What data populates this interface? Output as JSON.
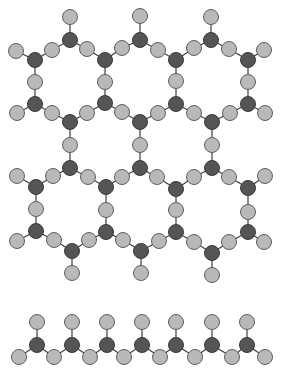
{
  "diagram": {
    "width": 289,
    "height": 375,
    "colors": {
      "background": "#ffffff",
      "light_atom": "#b9b9b9",
      "dark_atom": "#555555",
      "bond": "#3c3c3c"
    },
    "atom_radius": 7.5,
    "sheet": {
      "description": "hexagonal sheet of linked tetrahedra (two rows of rings)",
      "atoms": [
        {
          "id": "p1",
          "x": 70,
          "y": 17,
          "t": "light"
        },
        {
          "id": "p2",
          "x": 140,
          "y": 16,
          "t": "light"
        },
        {
          "id": "p3",
          "x": 211,
          "y": 17,
          "t": "light"
        },
        {
          "id": "a1",
          "x": 70,
          "y": 40,
          "t": "dark"
        },
        {
          "id": "a2",
          "x": 140,
          "y": 40,
          "t": "dark"
        },
        {
          "id": "a3",
          "x": 211,
          "y": 40,
          "t": "dark"
        },
        {
          "id": "b0",
          "x": 16,
          "y": 51,
          "t": "light"
        },
        {
          "id": "b1",
          "x": 52,
          "y": 50,
          "t": "light"
        },
        {
          "id": "b2",
          "x": 87,
          "y": 49,
          "t": "light"
        },
        {
          "id": "b3",
          "x": 122,
          "y": 48,
          "t": "light"
        },
        {
          "id": "b4",
          "x": 158,
          "y": 50,
          "t": "light"
        },
        {
          "id": "b5",
          "x": 194,
          "y": 48,
          "t": "light"
        },
        {
          "id": "b6",
          "x": 229,
          "y": 49,
          "t": "light"
        },
        {
          "id": "b7",
          "x": 264,
          "y": 50,
          "t": "light"
        },
        {
          "id": "c1",
          "x": 35,
          "y": 60,
          "t": "dark"
        },
        {
          "id": "c2",
          "x": 105,
          "y": 60,
          "t": "dark"
        },
        {
          "id": "c3",
          "x": 176,
          "y": 60,
          "t": "dark"
        },
        {
          "id": "c4",
          "x": 248,
          "y": 60,
          "t": "dark"
        },
        {
          "id": "d1",
          "x": 35,
          "y": 82,
          "t": "light"
        },
        {
          "id": "d2",
          "x": 105,
          "y": 82,
          "t": "light"
        },
        {
          "id": "d3",
          "x": 176,
          "y": 81,
          "t": "light"
        },
        {
          "id": "d4",
          "x": 248,
          "y": 82,
          "t": "light"
        },
        {
          "id": "e1",
          "x": 35,
          "y": 104,
          "t": "dark"
        },
        {
          "id": "e2",
          "x": 105,
          "y": 103,
          "t": "dark"
        },
        {
          "id": "e3",
          "x": 176,
          "y": 104,
          "t": "dark"
        },
        {
          "id": "e4",
          "x": 248,
          "y": 104,
          "t": "dark"
        },
        {
          "id": "f0",
          "x": 17,
          "y": 113,
          "t": "light"
        },
        {
          "id": "f1",
          "x": 52,
          "y": 113,
          "t": "light"
        },
        {
          "id": "f2",
          "x": 87,
          "y": 113,
          "t": "light"
        },
        {
          "id": "f3",
          "x": 122,
          "y": 112,
          "t": "light"
        },
        {
          "id": "f4",
          "x": 158,
          "y": 113,
          "t": "light"
        },
        {
          "id": "f5",
          "x": 194,
          "y": 113,
          "t": "light"
        },
        {
          "id": "f6",
          "x": 230,
          "y": 113,
          "t": "light"
        },
        {
          "id": "f7",
          "x": 265,
          "y": 113,
          "t": "light"
        },
        {
          "id": "g1",
          "x": 70,
          "y": 122,
          "t": "dark"
        },
        {
          "id": "g2",
          "x": 140,
          "y": 122,
          "t": "dark"
        },
        {
          "id": "g3",
          "x": 212,
          "y": 122,
          "t": "dark"
        },
        {
          "id": "h1",
          "x": 70,
          "y": 145,
          "t": "light"
        },
        {
          "id": "h2",
          "x": 140,
          "y": 145,
          "t": "light"
        },
        {
          "id": "h3",
          "x": 212,
          "y": 145,
          "t": "light"
        },
        {
          "id": "i1",
          "x": 70,
          "y": 168,
          "t": "dark"
        },
        {
          "id": "i2",
          "x": 140,
          "y": 168,
          "t": "dark"
        },
        {
          "id": "i3",
          "x": 212,
          "y": 168,
          "t": "dark"
        },
        {
          "id": "j0",
          "x": 17,
          "y": 176,
          "t": "light"
        },
        {
          "id": "j1",
          "x": 53,
          "y": 176,
          "t": "light"
        },
        {
          "id": "j2",
          "x": 88,
          "y": 177,
          "t": "light"
        },
        {
          "id": "j3",
          "x": 122,
          "y": 177,
          "t": "light"
        },
        {
          "id": "j4",
          "x": 157,
          "y": 177,
          "t": "light"
        },
        {
          "id": "j5",
          "x": 194,
          "y": 177,
          "t": "light"
        },
        {
          "id": "j6",
          "x": 229,
          "y": 177,
          "t": "light"
        },
        {
          "id": "j7",
          "x": 265,
          "y": 176,
          "t": "light"
        },
        {
          "id": "k1",
          "x": 36,
          "y": 187,
          "t": "dark"
        },
        {
          "id": "k2",
          "x": 106,
          "y": 187,
          "t": "dark"
        },
        {
          "id": "k3",
          "x": 176,
          "y": 189,
          "t": "dark"
        },
        {
          "id": "k4",
          "x": 248,
          "y": 188,
          "t": "dark"
        },
        {
          "id": "l1",
          "x": 36,
          "y": 209,
          "t": "light"
        },
        {
          "id": "l2",
          "x": 106,
          "y": 210,
          "t": "light"
        },
        {
          "id": "l3",
          "x": 176,
          "y": 210,
          "t": "light"
        },
        {
          "id": "l4",
          "x": 248,
          "y": 212,
          "t": "light"
        },
        {
          "id": "m1",
          "x": 36,
          "y": 231,
          "t": "dark"
        },
        {
          "id": "m2",
          "x": 106,
          "y": 232,
          "t": "dark"
        },
        {
          "id": "m3",
          "x": 176,
          "y": 232,
          "t": "dark"
        },
        {
          "id": "m4",
          "x": 248,
          "y": 232,
          "t": "dark"
        },
        {
          "id": "n0",
          "x": 17,
          "y": 241,
          "t": "light"
        },
        {
          "id": "n1",
          "x": 54,
          "y": 240,
          "t": "light"
        },
        {
          "id": "n2",
          "x": 89,
          "y": 240,
          "t": "light"
        },
        {
          "id": "n3",
          "x": 123,
          "y": 240,
          "t": "light"
        },
        {
          "id": "n4",
          "x": 159,
          "y": 241,
          "t": "light"
        },
        {
          "id": "n5",
          "x": 194,
          "y": 242,
          "t": "light"
        },
        {
          "id": "n6",
          "x": 229,
          "y": 242,
          "t": "light"
        },
        {
          "id": "n7",
          "x": 264,
          "y": 242,
          "t": "light"
        },
        {
          "id": "o1",
          "x": 72,
          "y": 251,
          "t": "dark"
        },
        {
          "id": "o2",
          "x": 141,
          "y": 251,
          "t": "dark"
        },
        {
          "id": "o3",
          "x": 212,
          "y": 253,
          "t": "dark"
        },
        {
          "id": "q1",
          "x": 72,
          "y": 273,
          "t": "light"
        },
        {
          "id": "q2",
          "x": 141,
          "y": 273,
          "t": "light"
        },
        {
          "id": "q3",
          "x": 212,
          "y": 275,
          "t": "light"
        }
      ],
      "bonds": [
        [
          "p1",
          "a1"
        ],
        [
          "p2",
          "a2"
        ],
        [
          "p3",
          "a3"
        ],
        [
          "b0",
          "c1"
        ],
        [
          "c1",
          "b1"
        ],
        [
          "b1",
          "a1"
        ],
        [
          "a1",
          "b2"
        ],
        [
          "b2",
          "c2"
        ],
        [
          "c2",
          "b3"
        ],
        [
          "b3",
          "a2"
        ],
        [
          "a2",
          "b4"
        ],
        [
          "b4",
          "c3"
        ],
        [
          "c3",
          "b5"
        ],
        [
          "b5",
          "a3"
        ],
        [
          "a3",
          "b6"
        ],
        [
          "b6",
          "c4"
        ],
        [
          "c4",
          "b7"
        ],
        [
          "c1",
          "d1"
        ],
        [
          "c2",
          "d2"
        ],
        [
          "c3",
          "d3"
        ],
        [
          "c4",
          "d4"
        ],
        [
          "d1",
          "e1"
        ],
        [
          "d2",
          "e2"
        ],
        [
          "d3",
          "e3"
        ],
        [
          "d4",
          "e4"
        ],
        [
          "f0",
          "e1"
        ],
        [
          "e1",
          "f1"
        ],
        [
          "f1",
          "g1"
        ],
        [
          "g1",
          "f2"
        ],
        [
          "f2",
          "e2"
        ],
        [
          "e2",
          "f3"
        ],
        [
          "f3",
          "g2"
        ],
        [
          "g2",
          "f4"
        ],
        [
          "f4",
          "e3"
        ],
        [
          "e3",
          "f5"
        ],
        [
          "f5",
          "g3"
        ],
        [
          "g3",
          "f6"
        ],
        [
          "f6",
          "e4"
        ],
        [
          "e4",
          "f7"
        ],
        [
          "g1",
          "h1"
        ],
        [
          "g2",
          "h2"
        ],
        [
          "g3",
          "h3"
        ],
        [
          "h1",
          "i1"
        ],
        [
          "h2",
          "i2"
        ],
        [
          "h3",
          "i3"
        ],
        [
          "j0",
          "k1"
        ],
        [
          "k1",
          "j1"
        ],
        [
          "j1",
          "i1"
        ],
        [
          "i1",
          "j2"
        ],
        [
          "j2",
          "k2"
        ],
        [
          "k2",
          "j3"
        ],
        [
          "j3",
          "i2"
        ],
        [
          "i2",
          "j4"
        ],
        [
          "j4",
          "k3"
        ],
        [
          "k3",
          "j5"
        ],
        [
          "j5",
          "i3"
        ],
        [
          "i3",
          "j6"
        ],
        [
          "j6",
          "k4"
        ],
        [
          "k4",
          "j7"
        ],
        [
          "k1",
          "l1"
        ],
        [
          "k2",
          "l2"
        ],
        [
          "k3",
          "l3"
        ],
        [
          "k4",
          "l4"
        ],
        [
          "l1",
          "m1"
        ],
        [
          "l2",
          "m2"
        ],
        [
          "l3",
          "m3"
        ],
        [
          "l4",
          "m4"
        ],
        [
          "n0",
          "m1"
        ],
        [
          "m1",
          "n1"
        ],
        [
          "n1",
          "o1"
        ],
        [
          "o1",
          "n2"
        ],
        [
          "n2",
          "m2"
        ],
        [
          "m2",
          "n3"
        ],
        [
          "n3",
          "o2"
        ],
        [
          "o2",
          "n4"
        ],
        [
          "n4",
          "m3"
        ],
        [
          "m3",
          "n5"
        ],
        [
          "n5",
          "o3"
        ],
        [
          "o3",
          "n6"
        ],
        [
          "n6",
          "m4"
        ],
        [
          "m4",
          "n7"
        ],
        [
          "o1",
          "q1"
        ],
        [
          "o2",
          "q2"
        ],
        [
          "o3",
          "q3"
        ]
      ]
    },
    "chain": {
      "description": "single chain of linked tetrahedra",
      "tetra_x": [
        37,
        72,
        107,
        142,
        176,
        212,
        247
      ],
      "top_y": 322,
      "center_y": 345,
      "bridge_x": [
        19,
        54,
        90,
        124,
        160,
        195,
        232,
        265
      ],
      "bridge_y": 357
    }
  }
}
